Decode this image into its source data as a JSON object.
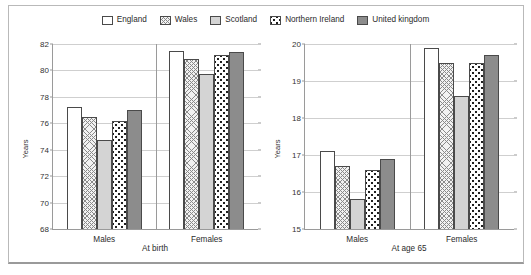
{
  "legend": {
    "items": [
      {
        "label": "England",
        "key": "england"
      },
      {
        "label": "Wales",
        "key": "wales"
      },
      {
        "label": "Scotland",
        "key": "scotland"
      },
      {
        "label": "Northern Ireland",
        "key": "nireland"
      },
      {
        "label": "United kingdom",
        "key": "uk"
      }
    ]
  },
  "colors": {
    "england": "#ffffff",
    "wales": "#f2f2f2",
    "scotland": "#d4d4d4",
    "nireland": "#ffffff",
    "uk": "#8c8c8c",
    "outline": "#4a4a4a",
    "grid": "#cfcfcf",
    "axis": "#9a9a9a",
    "frame": "#b9b9b9"
  },
  "chart_data": [
    {
      "type": "bar",
      "title": "At birth",
      "xlabel": "",
      "ylabel": "Years",
      "categories": [
        "Males",
        "Females"
      ],
      "ylim": [
        68,
        82
      ],
      "yticks": [
        68,
        70,
        72,
        74,
        76,
        78,
        80,
        82
      ],
      "grid": true,
      "legend_position": "top-center",
      "series": [
        {
          "name": "England",
          "key": "england",
          "values": [
            77.2,
            81.5
          ]
        },
        {
          "name": "Wales",
          "key": "wales",
          "values": [
            76.5,
            80.9
          ]
        },
        {
          "name": "Scotland",
          "key": "scotland",
          "values": [
            74.7,
            79.7
          ]
        },
        {
          "name": "Northern Ireland",
          "key": "nireland",
          "values": [
            76.2,
            81.2
          ]
        },
        {
          "name": "United kingdom",
          "key": "uk",
          "values": [
            77.0,
            81.4
          ]
        }
      ]
    },
    {
      "type": "bar",
      "title": "At age 65",
      "xlabel": "",
      "ylabel": "Years",
      "categories": [
        "Males",
        "Females"
      ],
      "ylim": [
        15,
        20
      ],
      "yticks": [
        15,
        16,
        17,
        18,
        19,
        20
      ],
      "grid": true,
      "legend_position": "top-center",
      "series": [
        {
          "name": "England",
          "key": "england",
          "values": [
            17.1,
            19.9
          ]
        },
        {
          "name": "Wales",
          "key": "wales",
          "values": [
            16.7,
            19.5
          ]
        },
        {
          "name": "Scotland",
          "key": "scotland",
          "values": [
            15.8,
            18.6
          ]
        },
        {
          "name": "Northern Ireland",
          "key": "nireland",
          "values": [
            16.6,
            19.5
          ]
        },
        {
          "name": "United kingdom",
          "key": "uk",
          "values": [
            16.9,
            19.7
          ]
        }
      ]
    }
  ]
}
